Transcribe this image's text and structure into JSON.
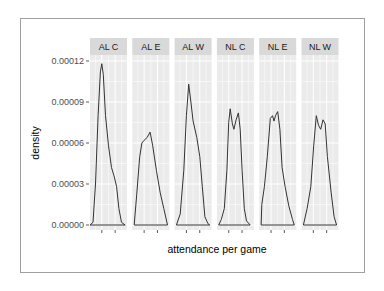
{
  "chart_data": {
    "type": "area",
    "subtype": "faceted density plot",
    "title": "",
    "xlabel": "attendance per game",
    "ylabel": "density",
    "ylim": [
      0,
      0.00013
    ],
    "yticks": [
      0.0,
      3e-05,
      6e-05,
      9e-05,
      0.00012
    ],
    "ytick_labels": [
      "0.00000",
      "0.00003",
      "0.00006",
      "0.00009",
      "0.00012"
    ],
    "grid": true,
    "legend": null,
    "facets": [
      {
        "label": "AL C",
        "peak_density": 0.000118,
        "shape": "single sharp peak, right skewed",
        "curve": [
          [
            0.0,
            0
          ],
          [
            0.08,
            2e-06
          ],
          [
            0.15,
            3e-05
          ],
          [
            0.22,
            8e-05
          ],
          [
            0.28,
            0.000112
          ],
          [
            0.32,
            0.000118
          ],
          [
            0.36,
            0.00011
          ],
          [
            0.42,
            8e-05
          ],
          [
            0.5,
            5.8e-05
          ],
          [
            0.58,
            4.2e-05
          ],
          [
            0.65,
            3.6e-05
          ],
          [
            0.72,
            2.8e-05
          ],
          [
            0.78,
            1.2e-05
          ],
          [
            0.85,
            2e-06
          ],
          [
            0.95,
            0
          ]
        ]
      },
      {
        "label": "AL E",
        "peak_density": 6.8e-05,
        "shape": "broad peak, right tail",
        "curve": [
          [
            0.05,
            0
          ],
          [
            0.12,
            2.2e-05
          ],
          [
            0.2,
            5e-05
          ],
          [
            0.26,
            6e-05
          ],
          [
            0.32,
            6.2e-05
          ],
          [
            0.4,
            6.4e-05
          ],
          [
            0.48,
            6.8e-05
          ],
          [
            0.55,
            5.8e-05
          ],
          [
            0.65,
            4e-05
          ],
          [
            0.75,
            2.4e-05
          ],
          [
            0.85,
            1.2e-05
          ],
          [
            0.95,
            0
          ]
        ]
      },
      {
        "label": "AL W",
        "peak_density": 0.000103,
        "shape": "single peak with shoulder",
        "curve": [
          [
            0.05,
            0
          ],
          [
            0.15,
            8e-06
          ],
          [
            0.25,
            4e-05
          ],
          [
            0.32,
            8e-05
          ],
          [
            0.38,
            0.000103
          ],
          [
            0.44,
            9e-05
          ],
          [
            0.5,
            7.6e-05
          ],
          [
            0.6,
            6.4e-05
          ],
          [
            0.68,
            5e-05
          ],
          [
            0.75,
            2.8e-05
          ],
          [
            0.82,
            6e-06
          ],
          [
            0.9,
            1e-06
          ],
          [
            0.95,
            0
          ]
        ]
      },
      {
        "label": "NL C",
        "peak_density": 8.5e-05,
        "shape": "bimodal",
        "curve": [
          [
            0.05,
            0
          ],
          [
            0.12,
            4e-06
          ],
          [
            0.2,
            1.2e-05
          ],
          [
            0.27,
            4e-05
          ],
          [
            0.32,
            7.5e-05
          ],
          [
            0.36,
            8.5e-05
          ],
          [
            0.42,
            7.4e-05
          ],
          [
            0.46,
            7e-05
          ],
          [
            0.52,
            7.7e-05
          ],
          [
            0.58,
            8.2e-05
          ],
          [
            0.63,
            7e-05
          ],
          [
            0.68,
            4e-05
          ],
          [
            0.74,
            1.2e-05
          ],
          [
            0.8,
            3e-06
          ],
          [
            0.9,
            0
          ]
        ]
      },
      {
        "label": "NL E",
        "peak_density": 8.3e-05,
        "shape": "bimodal, left shoulder",
        "curve": [
          [
            0.05,
            0
          ],
          [
            0.07,
            1.5e-05
          ],
          [
            0.14,
            2.8e-05
          ],
          [
            0.22,
            5e-05
          ],
          [
            0.3,
            7.8e-05
          ],
          [
            0.36,
            8e-05
          ],
          [
            0.4,
            7.6e-05
          ],
          [
            0.44,
            8e-05
          ],
          [
            0.5,
            8.3e-05
          ],
          [
            0.56,
            7e-05
          ],
          [
            0.62,
            4.2e-05
          ],
          [
            0.7,
            2.8e-05
          ],
          [
            0.8,
            1.4e-05
          ],
          [
            0.9,
            4e-06
          ],
          [
            0.95,
            0
          ]
        ]
      },
      {
        "label": "NL W",
        "peak_density": 8e-05,
        "shape": "bimodal",
        "curve": [
          [
            0.05,
            0
          ],
          [
            0.15,
            1.2e-05
          ],
          [
            0.25,
            2.8e-05
          ],
          [
            0.33,
            5.8e-05
          ],
          [
            0.4,
            8e-05
          ],
          [
            0.46,
            7.3e-05
          ],
          [
            0.52,
            7e-05
          ],
          [
            0.58,
            7.7e-05
          ],
          [
            0.64,
            7.4e-05
          ],
          [
            0.7,
            5e-05
          ],
          [
            0.8,
            2.4e-05
          ],
          [
            0.88,
            6e-06
          ],
          [
            0.95,
            0
          ]
        ]
      }
    ],
    "colors": {
      "panel_bg": "#ebebeb",
      "strip_bg": "#d9d9d9",
      "grid": "#ffffff",
      "line": "#333333",
      "fill": "none"
    }
  }
}
